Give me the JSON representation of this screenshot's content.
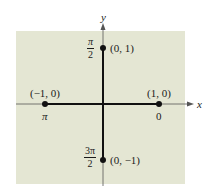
{
  "diagram": {
    "type": "unit-circle-points-on-axes",
    "background_color": "#e4e6d3",
    "axis_color": "#555555",
    "segment_color": "#111111",
    "axes": {
      "x_label": "x",
      "y_label": "y"
    },
    "points": [
      {
        "id": "right",
        "coord_label": "(1, 0)",
        "angle_label": "0"
      },
      {
        "id": "top",
        "coord_label": "(0, 1)",
        "angle_num": "π",
        "angle_den": "2"
      },
      {
        "id": "left",
        "coord_label": "(−1, 0)",
        "angle_label": "π"
      },
      {
        "id": "bottom",
        "coord_label": "(0, −1)",
        "angle_num": "3π",
        "angle_den": "2"
      }
    ]
  }
}
